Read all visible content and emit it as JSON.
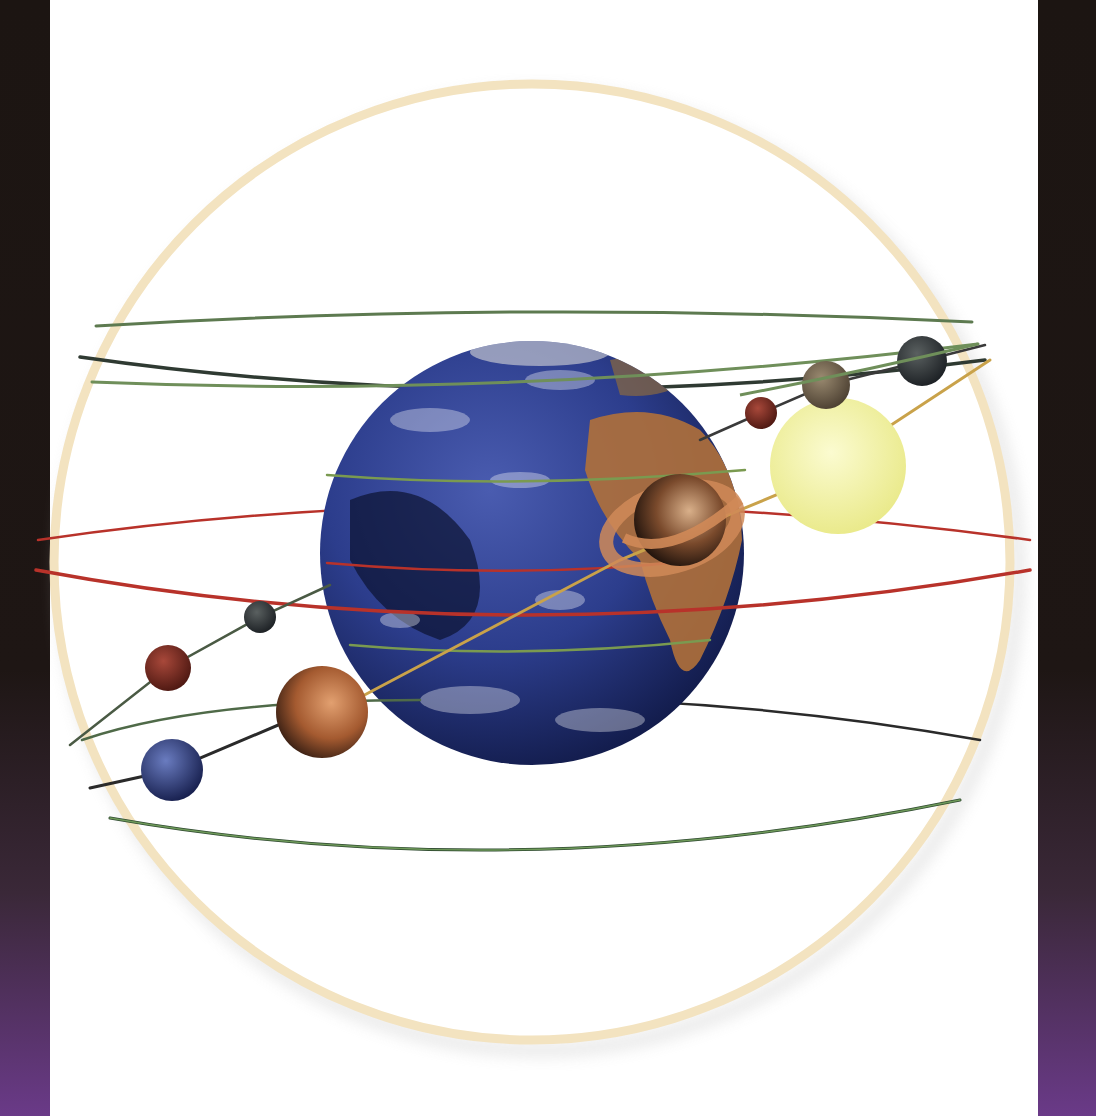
{
  "scene": {
    "description": "Illustration of the geocentric model: Earth at the centre of a crystalline sphere with planetary orbits and planets on rods",
    "colors": {
      "frame_dark": "#1c1512",
      "frame_purple": "#6a3a88",
      "sphere_rim": "#f3e3c0",
      "earth_ocean": "#2c3d8c",
      "earth_land": "#b0703a",
      "sun": "#f2f1a0",
      "orbit_green": "#6f8f5a",
      "orbit_red": "#b8322a",
      "orbit_dark": "#2a2a2a",
      "rod_gold": "#c9a24a"
    },
    "bodies": [
      {
        "name": "earth",
        "cx": 532,
        "cy": 553,
        "r": 212
      },
      {
        "name": "sun",
        "cx": 838,
        "cy": 466,
        "r": 68
      },
      {
        "name": "saturn",
        "cx": 680,
        "cy": 520,
        "r": 46
      },
      {
        "name": "jupiter",
        "cx": 322,
        "cy": 712,
        "r": 46
      },
      {
        "name": "moon-dark",
        "cx": 922,
        "cy": 361,
        "r": 25
      },
      {
        "name": "mercury",
        "cx": 826,
        "cy": 385,
        "r": 24
      },
      {
        "name": "mars-small",
        "cx": 761,
        "cy": 413,
        "r": 16
      },
      {
        "name": "venus",
        "cx": 260,
        "cy": 617,
        "r": 16
      },
      {
        "name": "mars",
        "cx": 168,
        "cy": 668,
        "r": 23
      },
      {
        "name": "neptune",
        "cx": 172,
        "cy": 770,
        "r": 31
      }
    ]
  }
}
